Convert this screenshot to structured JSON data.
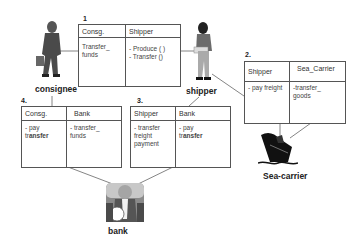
{
  "actors": {
    "consignee": {
      "label": "consignee",
      "icon": "person-with-briefcase-icon"
    },
    "shipper": {
      "label": "shipper",
      "icon": "person-holding-package-icon"
    },
    "bank": {
      "label": "bank",
      "icon": "bank-teller-icon"
    },
    "sea_carrier": {
      "label": "Sea-carrier",
      "icon": "ship-icon"
    }
  },
  "contracts": [
    {
      "number": "1",
      "left": {
        "header": "Consg.",
        "body": "Transfer_\n        funds"
      },
      "right": {
        "header": "Shipper",
        "body": "- Produce ( )\n- Transfer ()"
      }
    },
    {
      "number": "2.",
      "left": {
        "header": "Shipper",
        "body": "- pay freight"
      },
      "right": {
        "header": "Sea_Carrier",
        "body": "-transfer_\n     goods"
      }
    },
    {
      "number": "3.",
      "left": {
        "header": "Shipper",
        "body": "- transfer\n  freight\n  payment"
      },
      "right": {
        "header": "Bank",
        "body_line1": "- pay",
        "body_line2_pre": "tr",
        "body_line2_bold": "ansfer"
      }
    },
    {
      "number": "4.",
      "left": {
        "header": "Consg.",
        "body_line1": "- pay",
        "body_line2_pre": "tr",
        "body_line2_bold": "ansfer"
      },
      "right": {
        "header": "Bank",
        "body": "- transfer_\n       funds"
      }
    }
  ],
  "colors": {
    "line": "#555555",
    "figure_dark": "#3a3a3a",
    "figure_mid": "#7a7a7a",
    "figure_light": "#b5b5b5"
  }
}
